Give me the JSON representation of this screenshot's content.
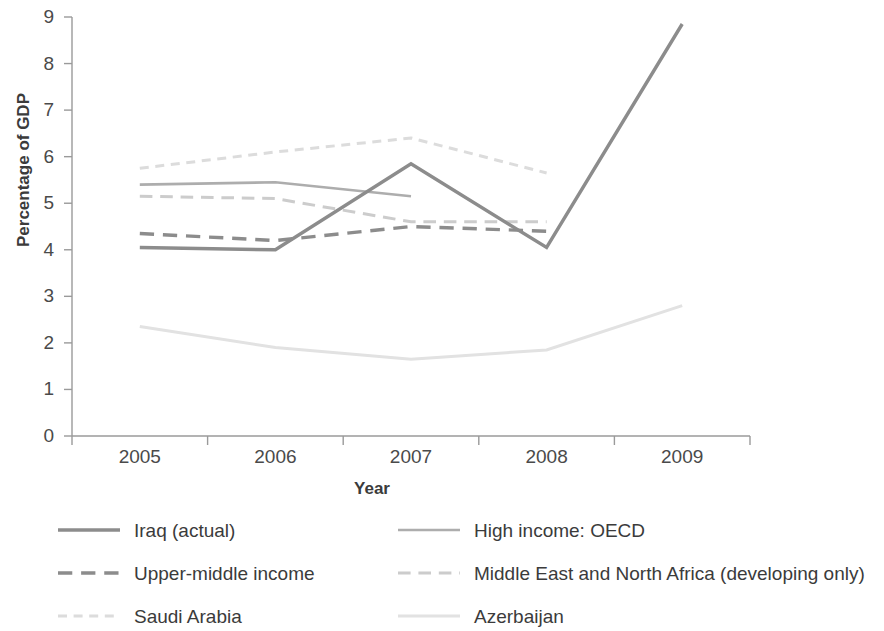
{
  "chart_data": {
    "type": "line",
    "title": "",
    "xlabel": "Year",
    "ylabel": "Percentage of GDP",
    "categories": [
      "2005",
      "2006",
      "2007",
      "2008",
      "2009"
    ],
    "x": [
      2005,
      2006,
      2007,
      2008,
      2009
    ],
    "ylim": [
      0,
      9
    ],
    "yticks": [
      0,
      1,
      2,
      3,
      4,
      5,
      6,
      7,
      8,
      9
    ],
    "ytick_labels": [
      "0",
      "1",
      "2",
      "3",
      "4",
      "5",
      "6",
      "7",
      "8",
      "9"
    ],
    "grid": false,
    "legend_position": "bottom",
    "legend_columns": 2,
    "series": [
      {
        "name": "Iraq (actual)",
        "values": [
          4.05,
          4.0,
          5.85,
          4.05,
          8.85
        ],
        "color": "#8c8c8c",
        "style": "solid",
        "width": 3.4
      },
      {
        "name": "High income: OECD",
        "values": [
          5.4,
          5.45,
          5.15,
          null,
          null
        ],
        "color": "#adadad",
        "style": "solid",
        "width": 2.6
      },
      {
        "name": "Upper-middle income",
        "values": [
          4.35,
          4.2,
          4.5,
          4.4,
          null
        ],
        "color": "#8c8c8c",
        "style": "dashed",
        "width": 3.4
      },
      {
        "name": "Middle East and North Africa (developing only)",
        "values": [
          5.15,
          5.1,
          4.6,
          4.6,
          null
        ],
        "color": "#cccccc",
        "style": "dashed",
        "width": 3.0
      },
      {
        "name": "Saudi Arabia",
        "values": [
          5.75,
          6.1,
          6.4,
          5.65,
          null
        ],
        "color": "#dcdcdc",
        "style": "dotted",
        "width": 3.0
      },
      {
        "name": "Azerbaijan",
        "values": [
          2.35,
          1.9,
          1.65,
          1.85,
          2.8
        ],
        "color": "#e2e2e2",
        "style": "solid",
        "width": 3.0
      }
    ]
  },
  "axis": {
    "y_title": "Percentage of GDP",
    "x_title": "Year"
  }
}
